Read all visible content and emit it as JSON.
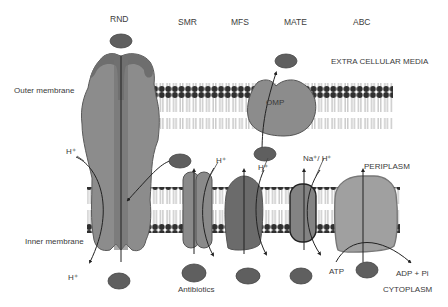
{
  "families": [
    {
      "id": "rnd",
      "label": "RND"
    },
    {
      "id": "smr",
      "label": "SMR"
    },
    {
      "id": "mfs",
      "label": "MFS"
    },
    {
      "id": "mate",
      "label": "MATE"
    },
    {
      "id": "abc",
      "label": "ABC"
    }
  ],
  "regions": {
    "extracellular": "EXTRA CELLULAR MEDIA",
    "periplasm": "PERIPLASM",
    "cytoplasm": "CYTOPLASM"
  },
  "membranes": {
    "outer": "Outer membrane",
    "inner": "Inner membrane"
  },
  "proteins": {
    "omp": "OMP"
  },
  "ions": {
    "rnd_top": "H⁺",
    "rnd_bottom": "H⁺",
    "smr": "H⁺",
    "mfs": "H⁺",
    "mate": "Na⁺/ H⁺"
  },
  "molecules": {
    "antibiotics": "Antibiotics",
    "atp": "ATP",
    "adp": "ADP + Pi"
  },
  "colors": {
    "protein_light": "#8c8c8c",
    "protein_mid": "#7a7a7a",
    "protein_dark": "#5e5e5e",
    "abc_fill": "#a0a0a0",
    "drug": "#5f5f5f",
    "lipid_head": "#2f2f2f",
    "line": "#222222"
  }
}
